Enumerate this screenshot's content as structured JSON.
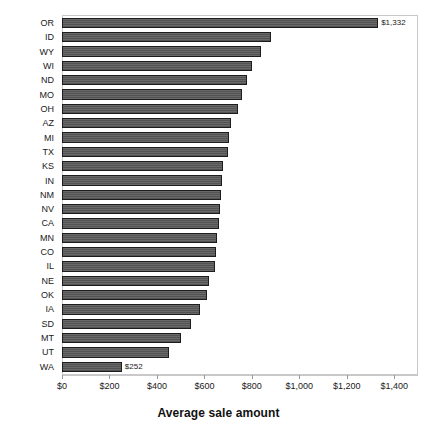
{
  "chart_data": {
    "type": "bar",
    "orientation": "horizontal",
    "title": "",
    "xlabel": "Average sale amount",
    "ylabel": "",
    "xlim": [
      0,
      1500
    ],
    "grid": false,
    "legend": null,
    "bar_color": "#585858",
    "categories": [
      "OR",
      "ID",
      "WY",
      "WI",
      "ND",
      "MO",
      "OH",
      "AZ",
      "MI",
      "TX",
      "KS",
      "IN",
      "NM",
      "NV",
      "CA",
      "MN",
      "CO",
      "IL",
      "NE",
      "OK",
      "IA",
      "SD",
      "MT",
      "UT",
      "WA"
    ],
    "values": [
      1332,
      880,
      840,
      800,
      780,
      760,
      740,
      710,
      705,
      700,
      680,
      675,
      670,
      665,
      660,
      655,
      650,
      645,
      620,
      610,
      580,
      545,
      500,
      450,
      252
    ],
    "xticks": [
      0,
      200,
      400,
      600,
      800,
      1000,
      1200,
      1400
    ],
    "xticklabels": [
      "$0",
      "$200",
      "$400",
      "$600",
      "$800",
      "$1,000",
      "$1,200",
      "$1,400"
    ],
    "data_labels": {
      "OR": "$1,332",
      "WA": "$252"
    },
    "labeled_bars": [
      "OR",
      "WA"
    ]
  },
  "axis": {
    "x_title": "Average sale amount"
  }
}
